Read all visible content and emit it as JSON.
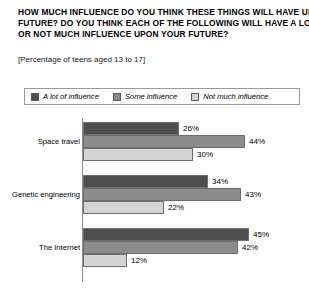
{
  "title": {
    "lines": [
      "HOW MUCH INFLUENCE DO YOU THINK THESE THINGS WILL HAVE UPON YOUR",
      "FUTURE? DO YOU THINK EACH OF THE FOLLOWING WILL HAVE A LOT, SOME,",
      "OR NOT MUCH INFLUENCE UPON YOUR FUTURE?"
    ]
  },
  "subtitle": "[Percentage of teens aged 13 to 17]",
  "legend": {
    "entries": [
      {
        "label": "A lot of influence",
        "color": "#4f4f4f"
      },
      {
        "label": "Some influence",
        "color": "#8c8c8c"
      },
      {
        "label": "Not much influence",
        "color": "#d4d4d4"
      }
    ]
  },
  "chart_data": {
    "type": "bar",
    "orientation": "horizontal",
    "title": "HOW MUCH INFLUENCE DO YOU THINK THESE THINGS WILL HAVE UPON YOUR FUTURE? DO YOU THINK EACH OF THE FOLLOWING WILL HAVE A LOT, SOME, OR NOT MUCH INFLUENCE UPON YOUR FUTURE?",
    "subtitle": "[Percentage of teens aged 13 to 17]",
    "xlabel": "",
    "ylabel": "",
    "xlim": [
      0,
      50
    ],
    "grid": false,
    "legend_position": "top",
    "categories": [
      "Space travel",
      "Genetic engineering",
      "The Internet"
    ],
    "series": [
      {
        "name": "A lot of influence",
        "color": "#4f4f4f",
        "values": [
          26,
          34,
          45
        ],
        "labels": [
          "26%",
          "34%",
          "45%"
        ]
      },
      {
        "name": "Some influence",
        "color": "#8c8c8c",
        "values": [
          44,
          43,
          42
        ],
        "labels": [
          "44%",
          "43%",
          "42%"
        ]
      },
      {
        "name": "Not much influence",
        "color": "#d4d4d4",
        "values": [
          30,
          22,
          12
        ],
        "labels": [
          "30%",
          "22%",
          "12%"
        ]
      }
    ]
  },
  "groups": [
    {
      "label": "Space travel",
      "bars": [
        {
          "series": "A lot of influence",
          "value": 26,
          "value_label": "26%",
          "color": "#4f4f4f"
        },
        {
          "series": "Some influence",
          "value": 44,
          "value_label": "44%",
          "color": "#8c8c8c"
        },
        {
          "series": "Not much influence",
          "value": 30,
          "value_label": "30%",
          "color": "#d4d4d4"
        }
      ]
    },
    {
      "label": "Genetic engineering",
      "bars": [
        {
          "series": "A lot of influence",
          "value": 34,
          "value_label": "34%",
          "color": "#4f4f4f"
        },
        {
          "series": "Some influence",
          "value": 43,
          "value_label": "43%",
          "color": "#8c8c8c"
        },
        {
          "series": "Not much influence",
          "value": 22,
          "value_label": "22%",
          "color": "#d4d4d4"
        }
      ]
    },
    {
      "label": "The Internet",
      "bars": [
        {
          "series": "A lot of influence",
          "value": 45,
          "value_label": "45%",
          "color": "#4f4f4f"
        },
        {
          "series": "Some influence",
          "value": 42,
          "value_label": "42%",
          "color": "#8c8c8c"
        },
        {
          "series": "Not much influence",
          "value": 12,
          "value_label": "12%",
          "color": "#d4d4d4"
        }
      ]
    }
  ]
}
